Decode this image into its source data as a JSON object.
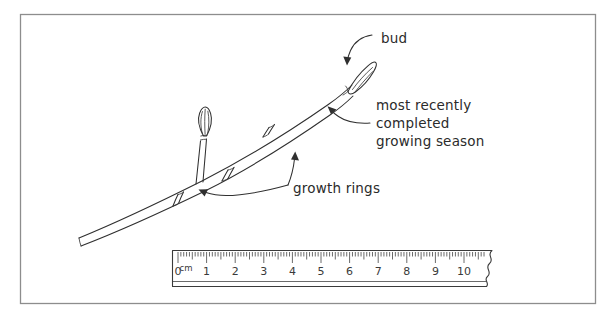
{
  "figure": {
    "background_color": "#ffffff",
    "ink_color": "#2f2f2f",
    "frame_color": "#8d8d8d"
  },
  "labels": {
    "bud": "bud",
    "season_line1": "most recently",
    "season_line2": "completed",
    "season_line3": "growing season",
    "growth_rings": "growth rings"
  },
  "ruler": {
    "unit": "cm",
    "numbers": [
      "0",
      "1",
      "2",
      "3",
      "4",
      "5",
      "6",
      "7",
      "8",
      "9",
      "10"
    ],
    "minor_ticks_per_cm": 10,
    "broken_right_edge": true
  },
  "parts": {
    "terminal_bud": "terminal-bud",
    "lateral_bud": "lateral-bud",
    "twig": "twig",
    "growth_ring_1": "growth-ring-lower",
    "growth_ring_2": "growth-ring-middle",
    "growth_ring_3": "growth-ring-upper"
  }
}
